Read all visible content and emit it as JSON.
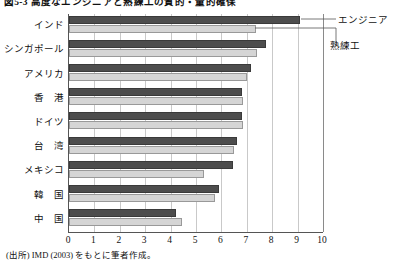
{
  "figure": {
    "title": "図5-3 高度なエンジニアと熟練工の質的・量的確保",
    "source_note": "(出所) IMD (2003) をもとに筆者作成。"
  },
  "legend": {
    "engineer_label": "エンジニア",
    "skilled_label": "熟練工",
    "engineer_color": "#4d4d4d",
    "skilled_color": "#d5d5d5"
  },
  "chart_data": {
    "type": "bar",
    "orientation": "horizontal",
    "title": "図5-3 高度なエンジニアと熟練工の質的・量的確保",
    "xlabel": "",
    "ylabel": "",
    "xlim": [
      0,
      10
    ],
    "xticks": [
      0,
      1,
      2,
      3,
      4,
      5,
      6,
      7,
      8,
      9,
      10
    ],
    "xtick_labels": [
      "0",
      "1",
      "2",
      "3",
      "4",
      "5",
      "6",
      "7",
      "8",
      "9",
      "10"
    ],
    "grid": true,
    "legend_position": "right-callout",
    "categories": [
      "インド",
      "シンガポール",
      "アメリカ",
      "香　港",
      "ドイツ",
      "台　湾",
      "メキシコ",
      "韓　国",
      "中　国"
    ],
    "series": [
      {
        "name": "エンジニア",
        "color": "#4d4d4d",
        "values": [
          9.1,
          7.75,
          7.15,
          6.8,
          6.8,
          6.6,
          6.45,
          5.9,
          4.2
        ]
      },
      {
        "name": "熟練工",
        "color": "#d5d5d5",
        "values": [
          7.35,
          7.4,
          7.0,
          6.85,
          6.85,
          6.5,
          5.3,
          5.75,
          4.45
        ]
      }
    ]
  }
}
